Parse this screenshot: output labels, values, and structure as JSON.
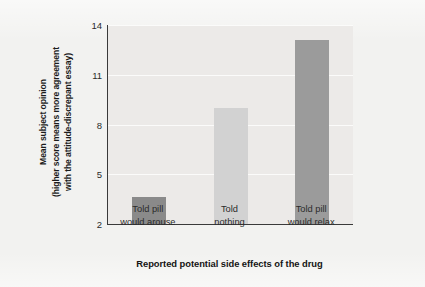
{
  "chart_data": {
    "type": "bar",
    "title": "",
    "categories": [
      "Told pill would arouse",
      "Told nothing",
      "Told pill would relax"
    ],
    "category_lines": [
      [
        "Told pill",
        "would arouse"
      ],
      [
        "Told",
        "nothing"
      ],
      [
        "Told pill",
        "would relax"
      ]
    ],
    "values": [
      3.6,
      9.0,
      13.1
    ],
    "series": [
      {
        "name": "Mean subject opinion",
        "values": [
          3.6,
          9.0,
          13.1
        ]
      }
    ],
    "xlabel": "Reported potential side effects of the drug",
    "ylabel": "Mean subject opinion (higher score means more agreement with the attitude-discrepant essay)",
    "ylabel_lines": [
      "Mean subject opinion",
      "(higher score means more agreement",
      "with the attitude-discrepant essay)"
    ],
    "yticks": [
      2,
      5,
      8,
      11,
      14
    ],
    "ytick_labels": [
      "2",
      "5",
      "8",
      "11",
      "14"
    ],
    "ylim": [
      2,
      14
    ],
    "grid": true,
    "legend": "none",
    "bar_colors": [
      "#8a8a8a",
      "#d2d2d2",
      "#9b9b9b"
    ],
    "plot_background": "#eceae8",
    "figure_background": "#f2f2f0",
    "axis_color": "#3a3a3a",
    "gridline_color": "#fbfbfa"
  }
}
